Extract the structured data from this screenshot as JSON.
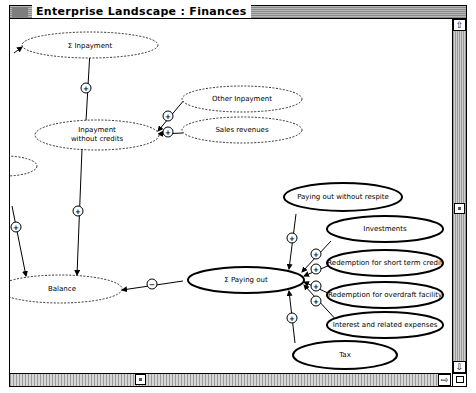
{
  "window": {
    "title": "Enterprise Landscape : Finances"
  },
  "diagram": {
    "nodes": [
      {
        "id": "sum_inpayment",
        "label": "Σ Inpayment",
        "style": "dashed"
      },
      {
        "id": "inpayment_wo_credits",
        "label_line1": "Inpayment",
        "label_line2": "without credits",
        "style": "dashed"
      },
      {
        "id": "other_inpayment",
        "label": "Other Inpayment",
        "style": "dashed"
      },
      {
        "id": "sales_revenues",
        "label": "Sales revenues",
        "style": "dashed"
      },
      {
        "id": "balance",
        "label": "Balance",
        "style": "dashed"
      },
      {
        "id": "sum_paying_out",
        "label": "Σ Paying out",
        "style": "bold"
      },
      {
        "id": "paying_out_wo_respite",
        "label": "Paying out without respite",
        "style": "bold"
      },
      {
        "id": "investments",
        "label": "Investments",
        "style": "bold"
      },
      {
        "id": "redemption_short_term",
        "label": "Redemption for short term credit",
        "style": "bold"
      },
      {
        "id": "redemption_overdraft",
        "label": "Redemption for overdraft facility",
        "style": "bold"
      },
      {
        "id": "interest_expenses",
        "label": "Interest and related expenses",
        "style": "bold"
      },
      {
        "id": "tax",
        "label": "Tax",
        "style": "bold"
      }
    ],
    "edges": [
      {
        "from": "inpayment_wo_credits",
        "to": "sum_inpayment",
        "sign": "+"
      },
      {
        "from": "other_inpayment",
        "to": "inpayment_wo_credits",
        "sign": "+"
      },
      {
        "from": "sales_revenues",
        "to": "inpayment_wo_credits",
        "sign": "+"
      },
      {
        "from": "inpayment_wo_credits",
        "to": "balance",
        "sign": "+"
      },
      {
        "from": "offscreen_left",
        "to": "balance",
        "sign": "+"
      },
      {
        "from": "sum_paying_out",
        "to": "balance",
        "sign": "−"
      },
      {
        "from": "paying_out_wo_respite",
        "to": "sum_paying_out",
        "sign": "+"
      },
      {
        "from": "investments",
        "to": "sum_paying_out",
        "sign": "+"
      },
      {
        "from": "redemption_short_term",
        "to": "sum_paying_out",
        "sign": "+"
      },
      {
        "from": "redemption_overdraft",
        "to": "sum_paying_out",
        "sign": "+"
      },
      {
        "from": "interest_expenses",
        "to": "sum_paying_out",
        "sign": "+"
      },
      {
        "from": "tax",
        "to": "sum_paying_out",
        "sign": "+"
      }
    ],
    "signs": {
      "plus": "+",
      "minus": "−"
    }
  },
  "scrollbars": {
    "up_arrow": "⇧",
    "down_arrow": "⇩",
    "left_arrow": "⇦",
    "right_arrow": "⇨"
  }
}
